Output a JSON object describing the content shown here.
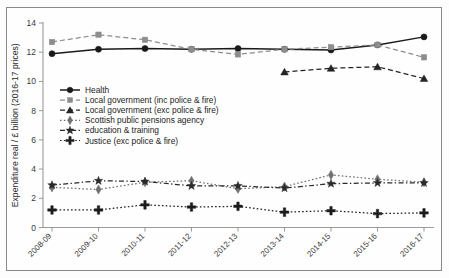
{
  "figure": {
    "frame_border_color": "#8a8a8a",
    "background": "#ffffff",
    "title": ""
  },
  "axes": {
    "y_axis_title": "Expenditure real / £ billion (2016-17 prices)",
    "x_axis_title": "",
    "y_ticks": [
      "0",
      "2",
      "4",
      "6",
      "8",
      "10",
      "12",
      "14"
    ],
    "x_ticks": [
      "2008-09",
      "2009-10",
      "2010-11",
      "2011-12",
      "2012-13",
      "2013-14",
      "2014-15",
      "2015-16",
      "2016-17"
    ]
  },
  "legend": {
    "items": [
      {
        "label": "Health",
        "marker": "circle",
        "dash": "solid",
        "color": "#1a1a1a"
      },
      {
        "label": "Local government (inc police & fire)",
        "marker": "square",
        "dash": "dashed",
        "color": "#8d8d8d"
      },
      {
        "label": "Local government (exc police & fire)",
        "marker": "triangle",
        "dash": "dashed",
        "color": "#242424"
      },
      {
        "label": "Scottish public pensions agency",
        "marker": "diamond",
        "dash": "dotted",
        "color": "#6f6f6f"
      },
      {
        "label": "education & training",
        "marker": "star",
        "dash": "dashdot",
        "color": "#2a2a2a"
      },
      {
        "label": "Justice (exc police & fire)",
        "marker": "plus",
        "dash": "dotted",
        "color": "#1c1c1c"
      }
    ]
  },
  "chart_data": {
    "type": "line",
    "title": "",
    "xlabel": "",
    "ylabel": "Expenditure real / £ billion (2016-17 prices)",
    "ylim": [
      0,
      14
    ],
    "ytick_step": 2,
    "grid": false,
    "legend_position": "inside-upper-left",
    "categories": [
      "2008-09",
      "2009-10",
      "2010-11",
      "2011-12",
      "2012-13",
      "2013-14",
      "2014-15",
      "2015-16",
      "2016-17"
    ],
    "series": [
      {
        "name": "Health",
        "marker": "circle",
        "dash": "solid",
        "color": "#1a1a1a",
        "values": [
          11.9,
          12.2,
          12.25,
          12.2,
          12.25,
          12.2,
          12.15,
          12.5,
          13.05
        ]
      },
      {
        "name": "Local government (inc police & fire)",
        "marker": "square",
        "dash": "dashed",
        "color": "#8d8d8d",
        "values": [
          12.7,
          13.2,
          12.85,
          12.2,
          11.85,
          12.2,
          12.35,
          12.5,
          11.65
        ]
      },
      {
        "name": "Local government (exc police & fire)",
        "marker": "triangle",
        "dash": "dashed",
        "color": "#242424",
        "values": [
          null,
          null,
          null,
          null,
          null,
          10.65,
          10.9,
          11.0,
          10.2
        ]
      },
      {
        "name": "Scottish public pensions agency",
        "marker": "diamond",
        "dash": "dotted",
        "color": "#6f6f6f",
        "values": [
          2.75,
          2.6,
          3.1,
          3.2,
          2.65,
          2.8,
          3.6,
          3.3,
          3.1
        ]
      },
      {
        "name": "education & training",
        "marker": "star",
        "dash": "dashdot",
        "color": "#2a2a2a",
        "values": [
          2.9,
          3.2,
          3.15,
          2.85,
          2.85,
          2.7,
          3.0,
          3.05,
          3.05
        ]
      },
      {
        "name": "Justice (exc police & fire)",
        "marker": "plus",
        "dash": "dotted",
        "color": "#1c1c1c",
        "values": [
          1.2,
          1.2,
          1.55,
          1.4,
          1.45,
          1.05,
          1.15,
          0.95,
          1.0
        ]
      }
    ]
  }
}
